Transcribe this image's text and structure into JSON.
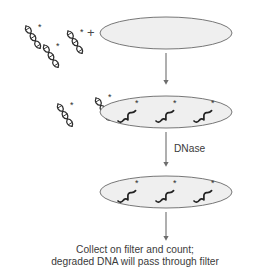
{
  "figure": {
    "background_color": "#ffffff",
    "ink_color": "#3b3b3b",
    "vessel_fill_color": "#efefef",
    "vessel_stroke_color": "#777777",
    "molecule_color": "#2e2e2e"
  },
  "labels": {
    "plus_sign": "+",
    "enzyme": "DNase",
    "caption_line1": "Collect on filter and count;",
    "caption_line2": "degraded DNA will pass through filter"
  },
  "stages": [
    {
      "name": "stage-1-mixing",
      "vessel": {
        "cx": 166,
        "cy": 33,
        "rx": 66,
        "ry": 16
      },
      "free_dna_helices": [
        {
          "x": 26,
          "y": 26,
          "star": "*"
        },
        {
          "x": 44,
          "y": 45,
          "star": "*"
        },
        {
          "x": 68,
          "y": 31,
          "star": "*"
        }
      ],
      "plus_position": {
        "x": 92,
        "y": 37
      }
    },
    {
      "name": "stage-2-bound",
      "vessel": {
        "cx": 166,
        "cy": 112,
        "rx": 66,
        "ry": 16
      },
      "free_dna_helices": [
        {
          "x": 58,
          "y": 110,
          "star": "*"
        },
        {
          "x": 96,
          "y": 104,
          "star": "*"
        }
      ],
      "bound_strands": [
        {
          "x": 120,
          "y": 118,
          "star": "*"
        },
        {
          "x": 158,
          "y": 118,
          "star": "*"
        },
        {
          "x": 196,
          "y": 118,
          "star": "*"
        }
      ]
    },
    {
      "name": "stage-3-digested",
      "vessel": {
        "cx": 166,
        "cy": 192,
        "rx": 66,
        "ry": 16
      },
      "bound_strands": [
        {
          "x": 120,
          "y": 198,
          "star": "*"
        },
        {
          "x": 158,
          "y": 198,
          "star": "*"
        },
        {
          "x": 196,
          "y": 198,
          "star": "*"
        }
      ]
    }
  ],
  "arrows": [
    {
      "name": "arrow-mix-to-bound",
      "x": 166,
      "y_start": 53,
      "y_end": 84,
      "label": ""
    },
    {
      "name": "arrow-dnase",
      "x": 166,
      "y_start": 132,
      "y_end": 166,
      "label": "DNase"
    },
    {
      "name": "arrow-to-filter",
      "x": 166,
      "y_start": 212,
      "y_end": 240,
      "label": ""
    }
  ]
}
